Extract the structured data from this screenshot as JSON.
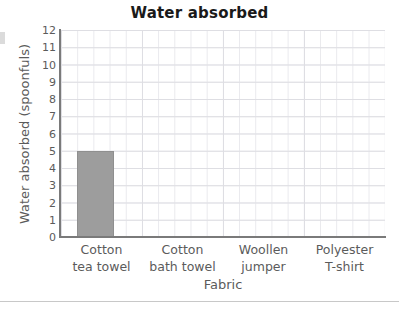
{
  "chart_data": {
    "type": "bar",
    "title": "Water absorbed",
    "xlabel": "Fabric",
    "ylabel": "Water absorbed (spoonfuls)",
    "categories": [
      "Cotton tea towel",
      "Cotton bath towel",
      "Woollen jumper",
      "Polyester T-shirt"
    ],
    "category_lines": [
      [
        "Cotton",
        "tea towel"
      ],
      [
        "Cotton",
        "bath towel"
      ],
      [
        "Woollen",
        "jumper"
      ],
      [
        "Polyester",
        "T-shirt"
      ]
    ],
    "values": [
      5,
      0,
      0,
      0
    ],
    "ylim": [
      0,
      12
    ],
    "yticks": [
      0,
      1,
      2,
      3,
      4,
      5,
      6,
      7,
      8,
      9,
      10,
      11,
      12
    ],
    "ytick_labels": [
      "0",
      "1",
      "2",
      "3",
      "4",
      "5",
      "6",
      "7",
      "8",
      "9",
      "10",
      "11",
      "12"
    ],
    "grid": true,
    "legend": false,
    "bar_color": "#9d9d9d",
    "bar_border_color": "#8f8f8f",
    "axis_color": "#7a7a7a",
    "grid_color": "#e9e9ed",
    "text_color": "#5b5b5b",
    "title_color": "#1a1a1a"
  }
}
